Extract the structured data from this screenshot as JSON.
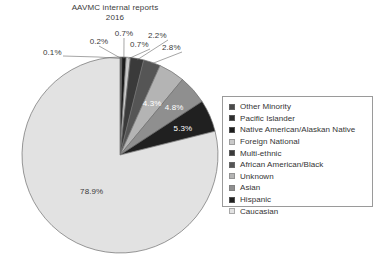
{
  "chart": {
    "title_line1": "AAVMC internal reports",
    "title_line2": "2016"
  },
  "legend": {
    "items": [
      {
        "label": "Other Minority",
        "color": "#4a4a4a"
      },
      {
        "label": "Pacific Islander",
        "color": "#2e2e2e"
      },
      {
        "label": "Native American/Alaskan Native",
        "color": "#1c1c1c"
      },
      {
        "label": "Foreign National",
        "color": "#c9c9c9"
      },
      {
        "label": "Multi-ethnic",
        "color": "#3a3a3a"
      },
      {
        "label": "African American/Black",
        "color": "#555555"
      },
      {
        "label": "Unknown",
        "color": "#b4b4b4"
      },
      {
        "label": "Asian",
        "color": "#8f8f8f"
      },
      {
        "label": "Hispanic",
        "color": "#202020"
      },
      {
        "label": "Caucasian",
        "color": "#e2e2e2"
      }
    ]
  },
  "labels": {
    "p_other_minority": "0.1%",
    "p_pacific_islander": "0.2%",
    "p_native_american": "0.7%",
    "p_foreign_national": "0.7%",
    "p_multi_ethnic": "2.2%",
    "p_african_american": "2.8%",
    "p_unknown": "4.3%",
    "p_asian": "4.8%",
    "p_hispanic": "5.3%",
    "p_caucasian": "78.9%"
  },
  "chart_data": {
    "type": "pie",
    "title": "AAVMC internal reports 2016",
    "labels": [
      "Other Minority",
      "Pacific Islander",
      "Native American/Alaskan Native",
      "Foreign National",
      "Multi-ethnic",
      "African American/Black",
      "Unknown",
      "Asian",
      "Hispanic",
      "Caucasian"
    ],
    "values": [
      0.1,
      0.2,
      0.7,
      0.7,
      2.2,
      2.8,
      4.3,
      4.8,
      5.3,
      78.9
    ],
    "value_labels": [
      "0.1%",
      "0.2%",
      "0.7%",
      "0.7%",
      "2.2%",
      "2.8%",
      "4.3%",
      "4.8%",
      "5.3%",
      "78.9%"
    ],
    "colors": [
      "#4a4a4a",
      "#2e2e2e",
      "#1c1c1c",
      "#c9c9c9",
      "#3a3a3a",
      "#555555",
      "#b4b4b4",
      "#8f8f8f",
      "#202020",
      "#e2e2e2"
    ],
    "unit": "percent",
    "start_angle_deg": 0,
    "direction": "clockwise",
    "legend_position": "right",
    "grid": false,
    "xlabel": "",
    "ylabel": ""
  }
}
